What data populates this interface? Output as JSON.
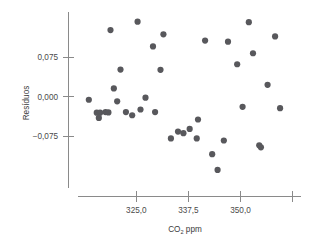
{
  "chart_data": {
    "type": "scatter",
    "title": "",
    "xlabel": "CO2 ppm",
    "xlabel_base": "CO",
    "xlabel_sub": "2",
    "xlabel_tail": " ppm",
    "ylabel": "Resíduos",
    "xticks": [
      "325,0",
      "337,5",
      "350,0"
    ],
    "xtick_values": [
      325.0,
      337.5,
      350.0
    ],
    "xtick_extra_unlabeled": 362.5,
    "yticks": [
      "0,075",
      "0,000",
      "−0,075"
    ],
    "ytick_values": [
      0.075,
      0.0,
      -0.075
    ],
    "xlim": [
      311.0,
      365.0
    ],
    "ylim": [
      -0.16,
      0.15
    ],
    "grid": false,
    "legend": null,
    "marker_color": "#58585c",
    "marker_size": 3.1,
    "axis_color": "#8a8a8a",
    "points": [
      {
        "x": 313.6,
        "y": -0.0055
      },
      {
        "x": 315.5,
        "y": -0.03
      },
      {
        "x": 316.3,
        "y": -0.03
      },
      {
        "x": 316.0,
        "y": -0.04
      },
      {
        "x": 317.6,
        "y": -0.029
      },
      {
        "x": 318.3,
        "y": -0.0295
      },
      {
        "x": 318.8,
        "y": 0.127
      },
      {
        "x": 319.6,
        "y": 0.016
      },
      {
        "x": 320.4,
        "y": -0.0085
      },
      {
        "x": 321.2,
        "y": 0.052
      },
      {
        "x": 322.5,
        "y": -0.029
      },
      {
        "x": 324.0,
        "y": -0.035
      },
      {
        "x": 325.3,
        "y": 0.143
      },
      {
        "x": 326.0,
        "y": -0.024
      },
      {
        "x": 327.2,
        "y": -0.0015
      },
      {
        "x": 329.0,
        "y": 0.096
      },
      {
        "x": 329.5,
        "y": -0.029
      },
      {
        "x": 330.8,
        "y": 0.0515
      },
      {
        "x": 331.5,
        "y": 0.119
      },
      {
        "x": 333.3,
        "y": -0.079
      },
      {
        "x": 335.0,
        "y": -0.066
      },
      {
        "x": 336.3,
        "y": -0.069
      },
      {
        "x": 337.8,
        "y": -0.061
      },
      {
        "x": 339.5,
        "y": -0.079
      },
      {
        "x": 339.8,
        "y": -0.043
      },
      {
        "x": 341.5,
        "y": 0.107
      },
      {
        "x": 343.2,
        "y": -0.109
      },
      {
        "x": 344.5,
        "y": -0.139
      },
      {
        "x": 346.0,
        "y": -0.083
      },
      {
        "x": 347.0,
        "y": 0.105
      },
      {
        "x": 349.2,
        "y": 0.062
      },
      {
        "x": 350.5,
        "y": -0.019
      },
      {
        "x": 352.0,
        "y": 0.142
      },
      {
        "x": 353.0,
        "y": 0.083
      },
      {
        "x": 354.5,
        "y": -0.092
      },
      {
        "x": 354.9,
        "y": -0.096
      },
      {
        "x": 356.5,
        "y": 0.023
      },
      {
        "x": 358.3,
        "y": 0.115
      },
      {
        "x": 359.5,
        "y": -0.0215
      }
    ]
  }
}
